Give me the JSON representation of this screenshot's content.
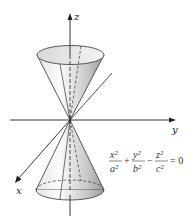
{
  "figure": {
    "axes": {
      "z_label": "z",
      "y_label": "y",
      "x_label": "x"
    },
    "equation": {
      "term1_num": "x²",
      "term1_den": "a²",
      "op1": "+",
      "term2_num": "y²",
      "term2_den": "b²",
      "op2": "−",
      "term3_num": "z²",
      "term3_den": "c²",
      "rhs": "= 0"
    },
    "colors": {
      "line": "#222222",
      "cone_light": "#f4f4f4",
      "cone_dark": "#9a9a9a"
    }
  }
}
